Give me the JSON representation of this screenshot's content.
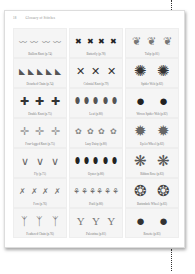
{
  "header": {
    "page_number": "18",
    "title": "Glossary of Stitches"
  },
  "stitches": [
    {
      "label": "Bullion Knot (p.74)",
      "glyph": "〰",
      "color": "#8a8a8a",
      "count": 4
    },
    {
      "label": "Butterfly (p.78)",
      "glyph": "✖",
      "color": "#222222",
      "count": 4
    },
    {
      "label": "Tulip (p.81)",
      "glyph": "❦",
      "color": "#777777",
      "count": 3
    },
    {
      "label": "Detached Chain (p.74)",
      "glyph": "◣",
      "color": "#555555",
      "count": 5
    },
    {
      "label": "Colonial Knot (p.79)",
      "glyph": "✕",
      "color": "#333333",
      "count": 3
    },
    {
      "label": "Spider Web (p.82)",
      "glyph": "✺",
      "color": "#333333",
      "count": 2
    },
    {
      "label": "Double Knot (p.75)",
      "glyph": "✚",
      "color": "#333333",
      "count": 3
    },
    {
      "label": "Leaf (p.80)",
      "glyph": "⬮",
      "color": "#555555",
      "count": 5
    },
    {
      "label": "Woven Spider Web (p.82)",
      "glyph": "●",
      "color": "#222222",
      "count": 2
    },
    {
      "label": "Four-legged Knot (p.75)",
      "glyph": "✛",
      "color": "#999999",
      "count": 3
    },
    {
      "label": "Lazy Daisy (p.80)",
      "glyph": "✿",
      "color": "#888888",
      "count": 4
    },
    {
      "label": "Eyelet Wheel (p.82)",
      "glyph": "✹",
      "color": "#666666",
      "count": 2
    },
    {
      "label": "Fly (p.75)",
      "glyph": "∨",
      "color": "#666666",
      "count": 3
    },
    {
      "label": "Oyster (p.80)",
      "glyph": "⬮",
      "color": "#222222",
      "count": 5
    },
    {
      "label": "Ribbon Rose (p.83)",
      "glyph": "❋",
      "color": "#555555",
      "count": 2
    },
    {
      "label": "Fern (p.76)",
      "glyph": "✗",
      "color": "#777777",
      "count": 4
    },
    {
      "label": "Pistil (p.80)",
      "glyph": "⚘",
      "color": "#666666",
      "count": 6
    },
    {
      "label": "Buttonhole Wheel (p.83)",
      "glyph": "❂",
      "color": "#444444",
      "count": 2
    },
    {
      "label": "Feathered Chain (p.76)",
      "glyph": "ᛉ",
      "color": "#666666",
      "count": 3
    },
    {
      "label": "Palestrina (p.81)",
      "glyph": "Y",
      "color": "#777777",
      "count": 3
    },
    {
      "label": "Rosette (p.83)",
      "glyph": "●",
      "color": "#333333",
      "count": 2
    }
  ]
}
